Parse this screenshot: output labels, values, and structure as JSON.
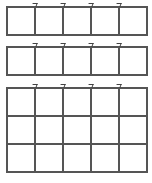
{
  "diagram": {
    "type": "empty-grids",
    "line_color": "#555555",
    "background": "#ffffff",
    "grids": [
      {
        "name": "grid-1",
        "rows": 1,
        "cols": 5,
        "top": 6
      },
      {
        "name": "grid-2",
        "rows": 1,
        "cols": 5,
        "top": 46
      },
      {
        "name": "grid-3",
        "rows": 3,
        "cols": 5,
        "top": 87
      }
    ]
  }
}
